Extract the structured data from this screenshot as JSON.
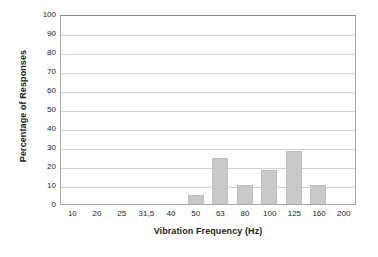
{
  "chart_data": {
    "type": "bar",
    "title": "",
    "xlabel": "Vibration Frequency (Hz)",
    "ylabel": "Percentage of Responses",
    "categories": [
      "10",
      "20",
      "25",
      "31,5",
      "40",
      "50",
      "63",
      "80",
      "100",
      "125",
      "160",
      "200"
    ],
    "values": [
      0,
      0,
      0,
      0,
      0,
      5,
      24,
      10,
      18,
      28,
      10,
      0
    ],
    "ylim": [
      0,
      100
    ],
    "ytick_labels": [
      "0",
      "10",
      "20",
      "30",
      "40",
      "50",
      "60",
      "70",
      "80",
      "90",
      "100"
    ],
    "ytick_values": [
      0,
      10,
      20,
      30,
      40,
      50,
      60,
      70,
      80,
      90,
      100
    ],
    "grid": "horizontal",
    "legend": "none",
    "colors": {
      "bar_fill": "#c9c9c9",
      "bar_edge": "#bdbdbd",
      "gridline": "#d2d2d2",
      "plot_border": "#a8a8a8",
      "text": "#1d1d1d",
      "background": "#ffffff"
    }
  }
}
